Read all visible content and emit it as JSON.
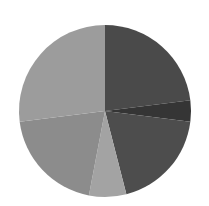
{
  "chart_data": {
    "type": "pie",
    "title": "",
    "legend": [],
    "center": [
      105,
      111
    ],
    "radius": 86,
    "start_angle_deg": 0,
    "direction": "clockwise",
    "slices": [
      {
        "label": "",
        "value": 23,
        "color": "#4a4a4a"
      },
      {
        "label": "",
        "value": 4,
        "color": "#353535"
      },
      {
        "label": "",
        "value": 19,
        "color": "#4d4d4d"
      },
      {
        "label": "",
        "value": 7,
        "color": "#a3a3a3"
      },
      {
        "label": "",
        "value": 20,
        "color": "#8c8c8c"
      },
      {
        "label": "",
        "value": 27,
        "color": "#9c9c9c"
      }
    ]
  }
}
